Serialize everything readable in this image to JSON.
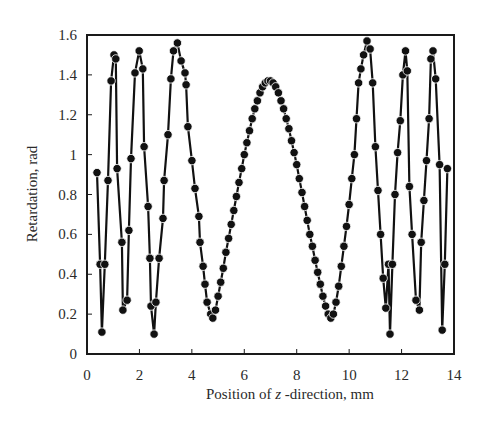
{
  "chart_data": {
    "type": "line",
    "title": "",
    "xlabel": "Position of z -direction, mm",
    "xlabel_parts": {
      "prefix": "Position of ",
      "italic": "z",
      "suffix": " -direction, mm"
    },
    "ylabel": "Retardation, rad",
    "xlim": [
      0,
      14
    ],
    "ylim": [
      0,
      1.6
    ],
    "xticks": [
      0,
      2,
      4,
      6,
      8,
      10,
      12,
      14
    ],
    "xtick_labels": [
      "0",
      "2",
      "4",
      "6",
      "8",
      "10",
      "12",
      "14"
    ],
    "yticks": [
      0,
      0.2,
      0.4,
      0.6,
      0.8,
      1.0,
      1.2,
      1.4,
      1.6
    ],
    "ytick_labels": [
      "0",
      "0.2",
      "0.4",
      "0.6",
      "0.8",
      "1",
      "1.2",
      "1.4",
      "1.6"
    ],
    "grid": false,
    "legend": null,
    "marker": "filled-circle",
    "line_color": "#111111",
    "series": [
      {
        "name": "Retardation",
        "x": [
          0.38,
          0.5,
          0.57,
          0.68,
          0.8,
          0.92,
          1.03,
          1.1,
          1.15,
          1.33,
          1.37,
          1.53,
          1.6,
          1.68,
          1.83,
          1.99,
          2.13,
          2.18,
          2.33,
          2.4,
          2.44,
          2.56,
          2.63,
          2.75,
          2.9,
          2.94,
          3.09,
          3.2,
          3.3,
          3.45,
          3.59,
          3.74,
          3.78,
          3.85,
          4.0,
          4.12,
          4.27,
          4.31,
          4.43,
          4.5,
          4.58,
          4.72,
          4.8,
          4.9,
          5.0,
          5.1,
          5.2,
          5.3,
          5.4,
          5.5,
          5.6,
          5.7,
          5.8,
          5.9,
          6.0,
          6.1,
          6.2,
          6.3,
          6.4,
          6.5,
          6.6,
          6.7,
          6.8,
          6.9,
          7.0,
          7.1,
          7.2,
          7.3,
          7.4,
          7.5,
          7.6,
          7.7,
          7.8,
          7.9,
          8.0,
          8.1,
          8.2,
          8.3,
          8.4,
          8.5,
          8.6,
          8.7,
          8.8,
          8.9,
          9.0,
          9.1,
          9.2,
          9.3,
          9.4,
          9.5,
          9.6,
          9.7,
          9.8,
          9.9,
          10.0,
          10.1,
          10.2,
          10.28,
          10.36,
          10.45,
          10.55,
          10.68,
          10.8,
          10.9,
          11.0,
          11.1,
          11.2,
          11.3,
          11.4,
          11.5,
          11.56,
          11.65,
          11.75,
          11.85,
          11.95,
          12.05,
          12.15,
          12.22,
          12.3,
          12.4,
          12.55,
          12.68,
          12.75,
          12.85,
          12.95,
          13.05,
          13.12,
          13.2,
          13.3,
          13.45,
          13.55,
          13.65,
          13.75
        ],
        "y": [
          0.91,
          0.45,
          0.11,
          0.45,
          0.87,
          1.37,
          1.5,
          1.48,
          0.93,
          0.56,
          0.22,
          0.27,
          0.62,
          0.98,
          1.41,
          1.52,
          1.43,
          1.04,
          0.74,
          0.48,
          0.24,
          0.1,
          0.26,
          0.48,
          0.68,
          0.87,
          1.1,
          1.38,
          1.52,
          1.56,
          1.47,
          1.41,
          1.35,
          1.14,
          0.97,
          0.83,
          0.69,
          0.56,
          0.44,
          0.35,
          0.26,
          0.2,
          0.18,
          0.22,
          0.29,
          0.36,
          0.43,
          0.51,
          0.58,
          0.65,
          0.72,
          0.79,
          0.86,
          0.93,
          1.0,
          1.06,
          1.12,
          1.18,
          1.23,
          1.27,
          1.31,
          1.34,
          1.36,
          1.37,
          1.37,
          1.36,
          1.34,
          1.31,
          1.27,
          1.23,
          1.18,
          1.13,
          1.07,
          1.01,
          0.95,
          0.88,
          0.81,
          0.74,
          0.67,
          0.6,
          0.54,
          0.47,
          0.41,
          0.35,
          0.29,
          0.24,
          0.2,
          0.18,
          0.2,
          0.26,
          0.34,
          0.44,
          0.54,
          0.64,
          0.75,
          0.88,
          1.0,
          1.18,
          1.36,
          1.43,
          1.5,
          1.57,
          1.53,
          1.36,
          1.04,
          0.82,
          0.6,
          0.38,
          0.23,
          0.45,
          0.1,
          0.45,
          0.8,
          1.01,
          1.17,
          1.4,
          1.52,
          1.42,
          0.84,
          0.6,
          0.27,
          0.22,
          0.56,
          0.77,
          0.97,
          1.18,
          1.48,
          1.52,
          1.38,
          0.95,
          0.12,
          0.45,
          0.93
        ]
      }
    ]
  }
}
